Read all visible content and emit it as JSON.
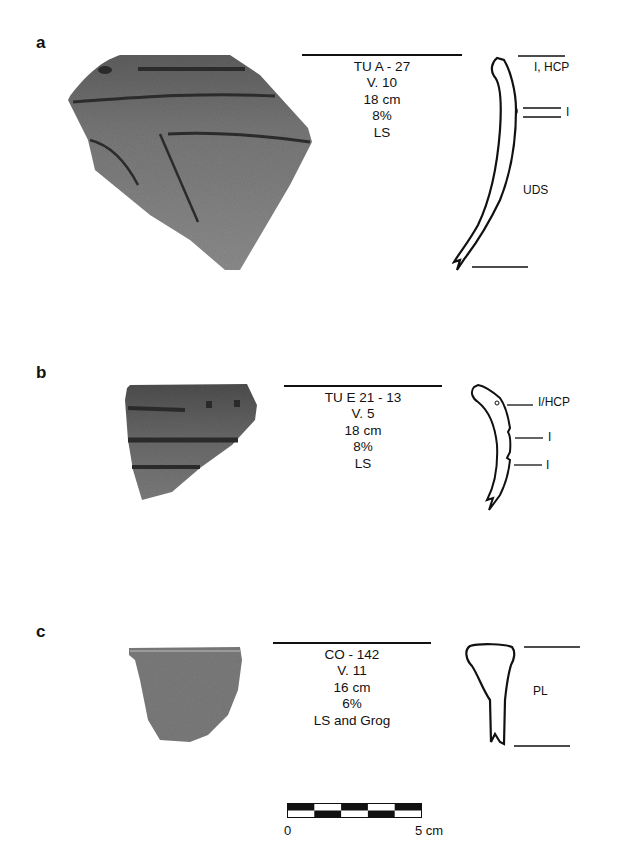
{
  "figure": {
    "panels": [
      {
        "label": "a",
        "info": [
          "TU A - 27",
          "V. 10",
          "18 cm",
          "8%",
          "LS"
        ],
        "profile_labels": {
          "top": "I, HCP",
          "mid": "I",
          "body": "UDS"
        }
      },
      {
        "label": "b",
        "info": [
          "TU E 21 - 13",
          "V. 5",
          "18 cm",
          "8%",
          "LS"
        ],
        "profile_labels": {
          "top": "I/HCP",
          "mid1": "I",
          "mid2": "I"
        }
      },
      {
        "label": "c",
        "info": [
          "CO - 142",
          "V. 11",
          "16 cm",
          "6%",
          "LS and Grog"
        ],
        "profile_labels": {
          "body": "PL"
        }
      }
    ],
    "scale_bar": {
      "start_label": "0",
      "end_label": "5 cm",
      "segments": 5
    },
    "colors": {
      "ink": "#111111",
      "sherd_dark": "#5a5a5a",
      "sherd_light": "#8a8a8a"
    }
  }
}
